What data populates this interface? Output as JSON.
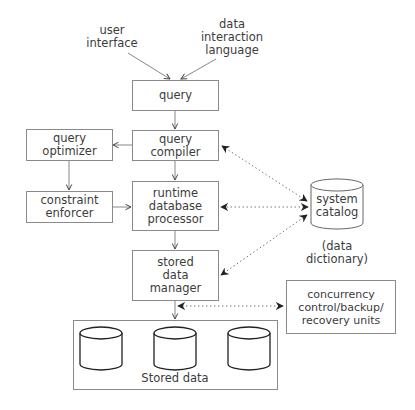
{
  "diagram": {
    "inputs": {
      "user_interface": "user\ninterface",
      "data_interaction_language": "data\ninteraction\nlanguage"
    },
    "nodes": {
      "query": "query",
      "query_compiler": "query\ncompiler",
      "query_optimizer": "query\noptimizer",
      "constraint_enforcer": "constraint\nenforcer",
      "runtime_db_processor": "runtime\ndatabase\nprocessor",
      "stored_data_manager": "stored\ndata\nmanager",
      "system_catalog": "system\ncatalog",
      "system_catalog_note": "(data\ndictionary)",
      "concurrency": "concurrency\ncontrol/backup/\nrecovery units",
      "stored_data": "Stored data"
    },
    "edges": [
      {
        "from": "user interface",
        "to": "query",
        "style": "solid"
      },
      {
        "from": "data interaction language",
        "to": "query",
        "style": "solid"
      },
      {
        "from": "query",
        "to": "query compiler",
        "style": "solid"
      },
      {
        "from": "query compiler",
        "to": "query optimizer",
        "style": "solid"
      },
      {
        "from": "query compiler",
        "to": "runtime database processor",
        "style": "solid"
      },
      {
        "from": "query optimizer",
        "to": "constraint enforcer",
        "style": "solid"
      },
      {
        "from": "constraint enforcer",
        "to": "runtime database processor",
        "style": "solid"
      },
      {
        "from": "runtime database processor",
        "to": "stored data manager",
        "style": "solid"
      },
      {
        "from": "stored data manager",
        "to": "stored data",
        "style": "solid"
      },
      {
        "from": "system catalog",
        "to": "query compiler",
        "style": "dotted",
        "bidirectional": true
      },
      {
        "from": "system catalog",
        "to": "runtime database processor",
        "style": "dotted",
        "bidirectional": true
      },
      {
        "from": "system catalog",
        "to": "stored data manager",
        "style": "dotted",
        "bidirectional": true
      },
      {
        "from": "stored data manager",
        "to": "concurrency control/backup/recovery units",
        "style": "dotted",
        "bidirectional": true
      }
    ],
    "colors": {
      "line": "#8a8a8a",
      "text": "#3c3c3c",
      "arrowhead": "#333333",
      "cylinder": "#222222"
    }
  }
}
